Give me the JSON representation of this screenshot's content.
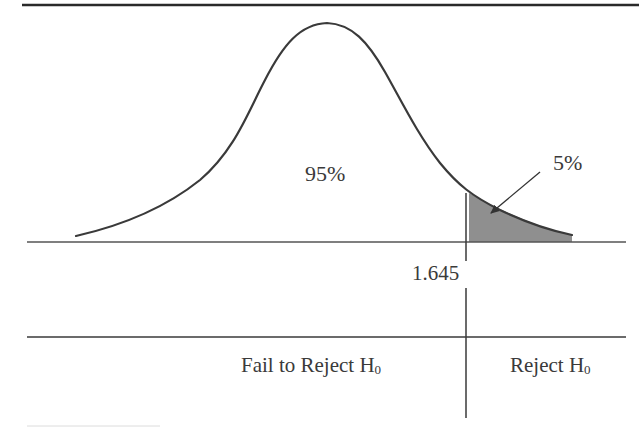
{
  "diagram": {
    "type": "one-tailed hypothesis test rejection region",
    "central_area_label": "95%",
    "tail_area_label": "5%",
    "critical_value_label": "1.645",
    "fail_region": {
      "text": "Fail to Reject H",
      "subscript": "0"
    },
    "reject_region": {
      "text": "Reject H",
      "subscript": "0"
    },
    "colors": {
      "line": "#3a3a3a",
      "curve": "#3a3a3a",
      "shaded_tail": "#8f8f8f",
      "background": "#ffffff"
    }
  }
}
